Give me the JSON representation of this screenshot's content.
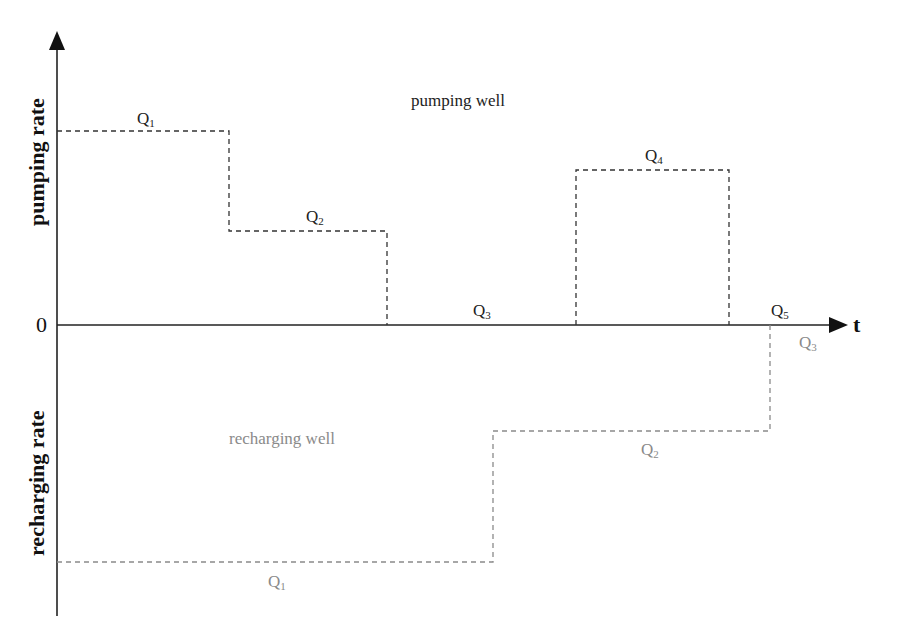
{
  "diagram": {
    "y_axis": {
      "positive_label": "pumping rate",
      "negative_label": "recharging rate",
      "origin_label": "0"
    },
    "x_axis": {
      "label": "t"
    },
    "regions": {
      "pumping": "pumping well",
      "recharging": "recharging well"
    },
    "pumping_well": {
      "color": "#333333",
      "steps": [
        {
          "label": "Q",
          "sub": "1",
          "x_start": 57,
          "x_end": 229,
          "y": 131
        },
        {
          "label": "Q",
          "sub": "2",
          "x_start": 229,
          "x_end": 387,
          "y": 231
        },
        {
          "label": "Q",
          "sub": "3",
          "x_start": 387,
          "x_end": 576,
          "y": 325
        },
        {
          "label": "Q",
          "sub": "4",
          "x_start": 576,
          "x_end": 729,
          "y": 170
        },
        {
          "label": "Q",
          "sub": "5",
          "x_start": 729,
          "x_end": 845,
          "y": 325
        }
      ]
    },
    "recharging_well": {
      "color": "#8a8a8a",
      "steps": [
        {
          "label": "Q",
          "sub": "1",
          "x_start": 57,
          "x_end": 493,
          "y": 562
        },
        {
          "label": "Q",
          "sub": "2",
          "x_start": 493,
          "x_end": 770,
          "y": 431
        },
        {
          "label": "Q",
          "sub": "3",
          "x_start": 770,
          "x_end": 845,
          "y": 325
        }
      ]
    }
  }
}
